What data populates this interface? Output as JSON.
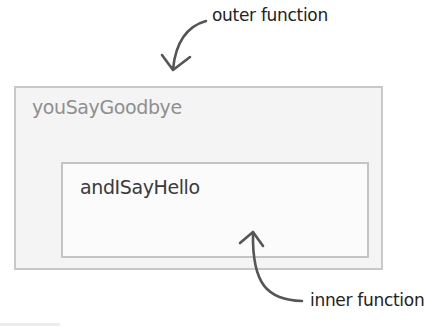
{
  "annotations": {
    "outer_label": "outer function",
    "inner_label": "inner function"
  },
  "outer_function": {
    "name": "youSayGoodbye"
  },
  "inner_function": {
    "name": "andISayHello"
  },
  "colors": {
    "outer_box_fill": "#f4f4f4",
    "outer_box_border": "#c8c8c8",
    "inner_box_fill": "#fbfbfb",
    "inner_box_border": "#c4c4c4",
    "outer_name_text": "#8f8f8f",
    "inner_name_text": "#3a3a3a",
    "arrow": "#555555"
  },
  "icons": {
    "outer_arrow": "curved-arrow-down-icon",
    "inner_arrow": "curved-arrow-up-icon"
  }
}
